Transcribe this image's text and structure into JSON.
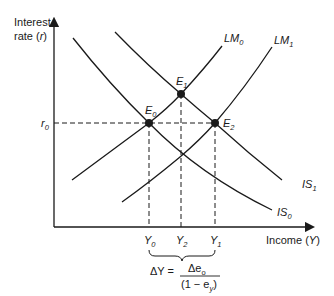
{
  "diagram": {
    "type": "IS-LM diagram",
    "y_axis_label": [
      "Interest",
      "rate (",
      "r",
      ")"
    ],
    "x_axis_label": [
      "Income (",
      "Y",
      ")"
    ],
    "r_level": {
      "sym": "r",
      "sub": "0"
    },
    "curves": [
      {
        "id": "LM0",
        "name": "LM",
        "sub": "0"
      },
      {
        "id": "LM1",
        "name": "LM",
        "sub": "1"
      },
      {
        "id": "IS0",
        "name": "IS",
        "sub": "0"
      },
      {
        "id": "IS1",
        "name": "IS",
        "sub": "1"
      }
    ],
    "points": [
      {
        "id": "E0",
        "name": "E",
        "sub": "0"
      },
      {
        "id": "E1",
        "name": "E",
        "sub": "1"
      },
      {
        "id": "E2",
        "name": "E",
        "sub": "2"
      }
    ],
    "income_levels": [
      {
        "id": "Y0",
        "name": "Y",
        "sub": "0"
      },
      {
        "id": "Y2",
        "name": "Y",
        "sub": "2"
      },
      {
        "id": "Y1",
        "name": "Y",
        "sub": "1"
      }
    ],
    "formula": {
      "lhs": "ΔY =",
      "numerator": "Δe",
      "numerator_sub": "o",
      "denominator_open": "(1 − e",
      "denominator_sub": "y",
      "denominator_close": ")"
    },
    "colors": {
      "ink": "#1a1a1a",
      "background": "#ffffff"
    }
  }
}
